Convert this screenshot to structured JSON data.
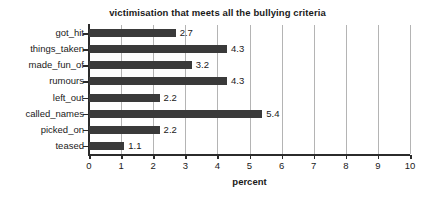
{
  "chart_data": {
    "type": "bar",
    "orientation": "horizontal",
    "title": "victimisation that meets all the bullying criteria",
    "xlabel": "percent",
    "ylabel": "",
    "xlim": [
      0,
      10
    ],
    "xticks": [
      "0",
      "1",
      "2",
      "3",
      "4",
      "5",
      "6",
      "7",
      "8",
      "9",
      "10"
    ],
    "grid": "vertical",
    "legend": "none",
    "bar_color": "#3a3a3a",
    "categories": [
      "got_hit",
      "things_taken",
      "made_fun_of",
      "rumours",
      "left_out",
      "called_names",
      "picked_on",
      "teased"
    ],
    "values": [
      2.7,
      4.3,
      3.2,
      4.3,
      2.2,
      5.4,
      2.2,
      1.1
    ],
    "data_labels": [
      "2.7",
      "4.3",
      "3.2",
      "4.3",
      "2.2",
      "5.4",
      "2.2",
      "1.1"
    ]
  }
}
